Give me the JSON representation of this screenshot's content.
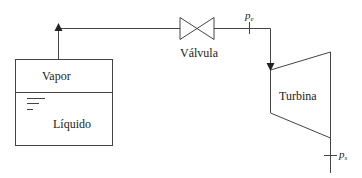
{
  "diagram": {
    "type": "process-flow",
    "colors": {
      "line": "#444444",
      "text": "#222222",
      "background": "#ffffff"
    },
    "tank": {
      "upper_label": "Vapor",
      "lower_label": "Líquido"
    },
    "valve": {
      "label": "Válvula"
    },
    "turbine": {
      "label": "Turbina"
    },
    "pressure_points": {
      "inlet": {
        "symbol": "p",
        "subscript": "e"
      },
      "outlet": {
        "symbol": "p",
        "subscript": "s"
      }
    }
  }
}
